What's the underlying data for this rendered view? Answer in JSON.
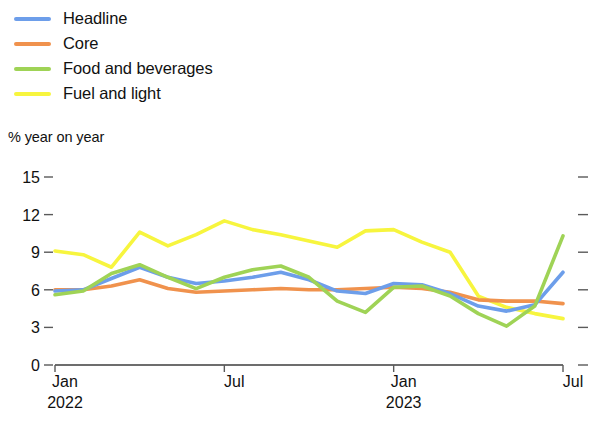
{
  "legend": {
    "position": "top-left",
    "items": [
      {
        "label": "Headline",
        "color": "#6d9eea",
        "series_key": "headline"
      },
      {
        "label": "Core",
        "color": "#f0924d",
        "series_key": "core"
      },
      {
        "label": "Food and beverages",
        "color": "#9fd356",
        "series_key": "food"
      },
      {
        "label": "Fuel and light",
        "color": "#f7f53e",
        "series_key": "fuel"
      }
    ]
  },
  "axis": {
    "y_title": "% year on year",
    "y_ticks": [
      "0",
      "3",
      "6",
      "9",
      "12",
      "15"
    ],
    "x_ticks": [
      {
        "label": "Jan",
        "sublabel": "2022"
      },
      {
        "label": "Jul",
        "sublabel": ""
      },
      {
        "label": "Jan",
        "sublabel": "2023"
      },
      {
        "label": "Jul",
        "sublabel": ""
      }
    ]
  },
  "chart_data": {
    "type": "line",
    "title": "",
    "subtitle": "",
    "xlabel": "",
    "ylabel": "% year on year",
    "ylim": [
      0,
      15
    ],
    "ytick_values": [
      0,
      3,
      6,
      9,
      12,
      15
    ],
    "grid": false,
    "legend_position": "top-left",
    "x": [
      "Jan 2022",
      "Feb 2022",
      "Mar 2022",
      "Apr 2022",
      "May 2022",
      "Jun 2022",
      "Jul 2022",
      "Aug 2022",
      "Sep 2022",
      "Oct 2022",
      "Nov 2022",
      "Dec 2022",
      "Jan 2023",
      "Feb 2023",
      "Mar 2023",
      "Apr 2023",
      "May 2023",
      "Jun 2023",
      "Jul 2023"
    ],
    "xtick_labels": [
      "Jan 2022",
      "Jul",
      "Jan 2023",
      "Jul"
    ],
    "xtick_indices": [
      0,
      6,
      12,
      18
    ],
    "series": [
      {
        "name": "Headline",
        "color": "#6d9eea",
        "values": [
          5.9,
          6.0,
          6.9,
          7.8,
          7.0,
          6.5,
          6.7,
          7.0,
          7.4,
          6.8,
          5.9,
          5.7,
          6.5,
          6.4,
          5.7,
          4.7,
          4.3,
          4.8,
          7.4
        ]
      },
      {
        "name": "Core",
        "color": "#f0924d",
        "values": [
          6.0,
          6.0,
          6.3,
          6.8,
          6.1,
          5.8,
          5.9,
          6.0,
          6.1,
          6.0,
          6.0,
          6.1,
          6.2,
          6.1,
          5.8,
          5.2,
          5.1,
          5.1,
          4.9
        ]
      },
      {
        "name": "Food and beverages",
        "color": "#9fd356",
        "values": [
          5.6,
          5.9,
          7.3,
          8.0,
          7.0,
          6.1,
          7.0,
          7.6,
          7.9,
          7.0,
          5.1,
          4.2,
          6.2,
          6.3,
          5.5,
          4.1,
          3.1,
          4.7,
          10.3
        ]
      },
      {
        "name": "Fuel and light",
        "color": "#f7f53e",
        "values": [
          9.1,
          8.8,
          7.8,
          10.6,
          9.5,
          10.4,
          11.5,
          10.8,
          10.4,
          9.9,
          9.4,
          10.7,
          10.8,
          9.8,
          9.0,
          5.5,
          4.6,
          4.1,
          3.7
        ]
      }
    ]
  }
}
